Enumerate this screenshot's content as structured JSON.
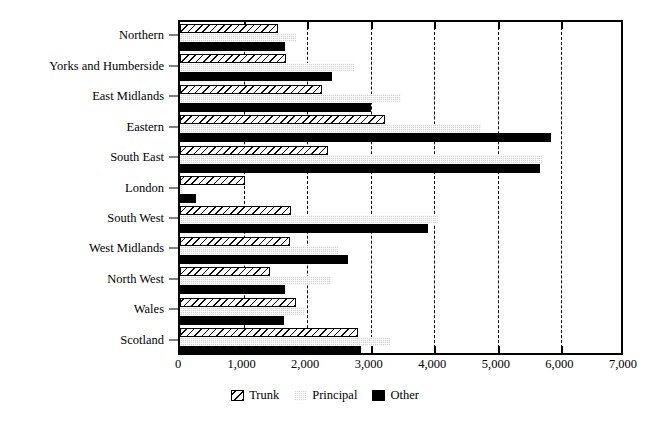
{
  "chart_data": {
    "type": "bar",
    "orientation": "horizontal",
    "title": "",
    "xlabel": "",
    "ylabel": "",
    "xlim": [
      0,
      7000
    ],
    "xticks": [
      0,
      1000,
      2000,
      3000,
      4000,
      5000,
      6000,
      7000
    ],
    "xtick_labels": [
      "0",
      "1,000",
      "2,000",
      "3,000",
      "4,000",
      "5,000",
      "6,000",
      "7,000"
    ],
    "grid": "vertical-dashed",
    "legend_position": "bottom-center",
    "categories": [
      "Northern",
      "Yorks and Humberside",
      "East Midlands",
      "Eastern",
      "South East",
      "London",
      "South West",
      "West Midlands",
      "North West",
      "Wales",
      "Scotland"
    ],
    "series": [
      {
        "name": "Trunk",
        "style": "hatched",
        "color": "#ffffff",
        "values": [
          1540,
          1660,
          2230,
          3220,
          2330,
          1030,
          1750,
          1730,
          1410,
          1830,
          2800
        ]
      },
      {
        "name": "Principal",
        "style": "stippled",
        "color": "#d2d2d2",
        "values": [
          1830,
          2730,
          3470,
          4730,
          5690,
          40,
          4060,
          2490,
          2370,
          1960,
          3300
        ]
      },
      {
        "name": "Other",
        "style": "solid",
        "color": "#000000",
        "values": [
          1650,
          2390,
          3000,
          5840,
          5660,
          250,
          3900,
          2640,
          1650,
          1640,
          2850
        ]
      }
    ]
  },
  "legend": {
    "items": [
      {
        "label": "Trunk",
        "swatch": "hatched-swatch"
      },
      {
        "label": "Principal",
        "swatch": "stippled-swatch"
      },
      {
        "label": "Other",
        "swatch": "black-swatch"
      }
    ]
  }
}
